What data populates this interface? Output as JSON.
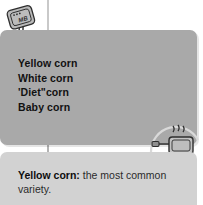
{
  "page": {
    "background_color": "#ffffff"
  },
  "colors": {
    "list_panel": "#a9a9a9",
    "caption_panel": "#d2d2d2",
    "rule": "#c9c9c9",
    "text_dark": "#111111",
    "icon_line": "#2e2e2e",
    "icon_fill": "#b9b9b9"
  },
  "list_panel": {
    "items": [
      {
        "label": "Yellow corn"
      },
      {
        "label": "White corn"
      },
      {
        "label": "'Diet\"corn"
      },
      {
        "label": "Baby corn"
      }
    ]
  },
  "caption_panel": {
    "lead": "Yellow corn:",
    "body": " the most common variety."
  },
  "icons": {
    "top_left": {
      "name": "tilted-appliance-icon",
      "inner_label": "MB"
    },
    "bottom_right": {
      "name": "steaming-toaster-icon"
    }
  }
}
